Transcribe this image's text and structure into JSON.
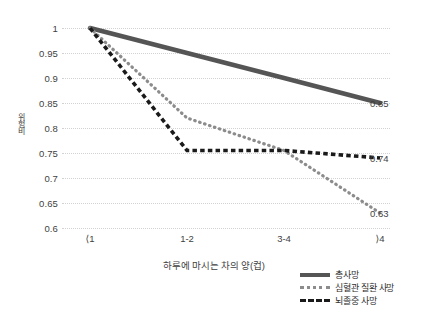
{
  "chart_data": {
    "type": "line",
    "title": "",
    "xlabel": "하루에 마시는 차의 양(컵)",
    "ylabel": "위험비",
    "categories": [
      "⟨1",
      "1-2",
      "3-4",
      "⟩4"
    ],
    "ylim": [
      0.6,
      1.0
    ],
    "ytick_labels": [
      "1",
      "0.95",
      "0.9",
      "0.85",
      "0.8",
      "0.75",
      "0.7",
      "0.65",
      "0.6"
    ],
    "ytick_values": [
      1,
      0.95,
      0.9,
      0.85,
      0.8,
      0.75,
      0.7,
      0.65,
      0.6
    ],
    "grid": true,
    "legend_position": "bottom-right",
    "series": [
      {
        "name": "총사망",
        "style": "solid",
        "color": "#555555",
        "values": [
          1.0,
          0.95,
          0.9,
          0.85
        ],
        "end_label": "0.85"
      },
      {
        "name": "심혈관 질환 사망",
        "style": "dotted",
        "color": "#8c8c8c",
        "values": [
          1.0,
          0.82,
          0.755,
          0.63
        ],
        "end_label": "0.63"
      },
      {
        "name": "뇌졸중 사망",
        "style": "dashed",
        "color": "#1a1a1a",
        "values": [
          1.0,
          0.755,
          0.755,
          0.74
        ],
        "end_label": "0.74"
      }
    ],
    "data_labels": [
      {
        "text": "0.85",
        "value": 0.85
      },
      {
        "text": "0.74",
        "value": 0.74
      },
      {
        "text": "0.63",
        "value": 0.63
      }
    ]
  }
}
